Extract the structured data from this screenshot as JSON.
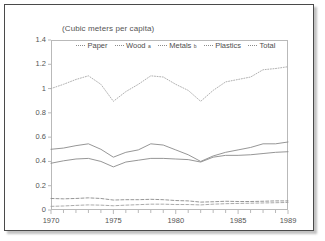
{
  "figure": {
    "subtitle": "(Cubic meters per capita)"
  },
  "chart_data": {
    "type": "line",
    "title": "",
    "subtitle": "(Cubic meters per capita)",
    "xlabel": "",
    "ylabel": "",
    "xlim": [
      1970,
      1989
    ],
    "ylim": [
      0,
      1.4
    ],
    "grid": false,
    "legend_position": "top-center",
    "x": [
      1970,
      1971,
      1972,
      1973,
      1974,
      1975,
      1976,
      1977,
      1978,
      1979,
      1980,
      1981,
      1982,
      1983,
      1984,
      1985,
      1986,
      1987,
      1988,
      1989
    ],
    "xticks": [
      1970,
      1975,
      1980,
      1985,
      1989
    ],
    "xticklabels": [
      "1970",
      "1975",
      "1980",
      "1985",
      "1989"
    ],
    "yticks": [
      0,
      0.2,
      0.4,
      0.6,
      0.8,
      1,
      1.2,
      1.4
    ],
    "yticklabels": [
      "0",
      "0.2",
      "0.4",
      "0.6",
      "0.8",
      "1",
      "1.2",
      "1.4"
    ],
    "series": [
      {
        "name": "Paper",
        "label": "Paper",
        "footnote": "",
        "style": "solid",
        "color": "#8a8a8a",
        "values": [
          0.5,
          0.51,
          0.53,
          0.545,
          0.5,
          0.435,
          0.475,
          0.495,
          0.545,
          0.535,
          0.495,
          0.455,
          0.4,
          0.445,
          0.475,
          0.495,
          0.515,
          0.545,
          0.545,
          0.56
        ]
      },
      {
        "name": "Wood",
        "label": "Wood",
        "footnote": "a",
        "style": "solid",
        "color": "#8a8a8a",
        "values": [
          0.385,
          0.405,
          0.42,
          0.425,
          0.4,
          0.355,
          0.395,
          0.41,
          0.425,
          0.425,
          0.42,
          0.415,
          0.395,
          0.435,
          0.45,
          0.45,
          0.455,
          0.465,
          0.475,
          0.48
        ]
      },
      {
        "name": "Metals",
        "label": "Metals",
        "footnote": "b",
        "style": "dashed",
        "color": "#8a8a8a",
        "values": [
          0.095,
          0.092,
          0.095,
          0.1,
          0.095,
          0.082,
          0.085,
          0.085,
          0.088,
          0.085,
          0.078,
          0.075,
          0.065,
          0.068,
          0.072,
          0.07,
          0.07,
          0.072,
          0.075,
          0.075
        ]
      },
      {
        "name": "Plastics",
        "label": "Plastics",
        "footnote": "",
        "style": "dashed",
        "color": "#a0a0a0",
        "values": [
          0.03,
          0.033,
          0.038,
          0.042,
          0.04,
          0.035,
          0.04,
          0.044,
          0.048,
          0.048,
          0.045,
          0.045,
          0.042,
          0.048,
          0.052,
          0.054,
          0.056,
          0.058,
          0.06,
          0.062
        ]
      },
      {
        "name": "Total",
        "label": "Total",
        "footnote": "",
        "style": "dotted",
        "color": "#a8a8a8",
        "values": [
          1.0,
          1.035,
          1.075,
          1.105,
          1.035,
          0.895,
          0.975,
          1.035,
          1.105,
          1.095,
          1.035,
          0.985,
          0.895,
          0.985,
          1.055,
          1.075,
          1.095,
          1.155,
          1.165,
          1.18
        ]
      }
    ]
  }
}
